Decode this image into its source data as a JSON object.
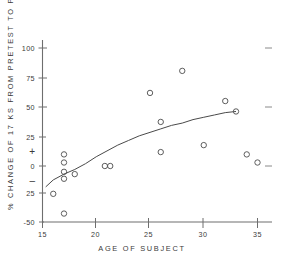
{
  "chart_data": {
    "type": "scatter",
    "title": "",
    "xlabel": "AGE OF SUBJECT",
    "ylabel": "% CHANGE OF 17 KS FROM PRETEST TO POST TEST",
    "xlim": [
      15,
      36
    ],
    "ylim": [
      -50,
      110
    ],
    "xticks": [
      15,
      20,
      25,
      30,
      35
    ],
    "xtick_labels": [
      "15",
      "20",
      "25",
      "30",
      "35"
    ],
    "yticks": [
      -50,
      -25,
      0,
      25,
      50,
      75,
      100
    ],
    "ytick_labels": [
      "-50",
      "25",
      "0",
      "25",
      "50",
      "75",
      "100"
    ],
    "y_sign_markers": [
      {
        "label": "+",
        "value": 12
      },
      {
        "label": "–",
        "value": -12
      }
    ],
    "grid": false,
    "legend": null,
    "marker": "open-circle",
    "points": [
      {
        "x": 16,
        "y": -24
      },
      {
        "x": 17,
        "y": -41
      },
      {
        "x": 17,
        "y": 10
      },
      {
        "x": 17,
        "y": -5
      },
      {
        "x": 17,
        "y": 3
      },
      {
        "x": 17,
        "y": -11
      },
      {
        "x": 18,
        "y": -7
      },
      {
        "x": 20.8,
        "y": 0
      },
      {
        "x": 21.3,
        "y": 0
      },
      {
        "x": 25,
        "y": 63
      },
      {
        "x": 26,
        "y": 38
      },
      {
        "x": 26,
        "y": 12
      },
      {
        "x": 28,
        "y": 82
      },
      {
        "x": 30,
        "y": 18
      },
      {
        "x": 32,
        "y": 56
      },
      {
        "x": 33,
        "y": 47
      },
      {
        "x": 34,
        "y": 10
      },
      {
        "x": 35,
        "y": 3
      }
    ],
    "fit_curve": {
      "description": "smooth increasing logarithmic trend line",
      "points": [
        {
          "x": 15.3,
          "y": -18
        },
        {
          "x": 16,
          "y": -12
        },
        {
          "x": 17,
          "y": -7
        },
        {
          "x": 18,
          "y": -3
        },
        {
          "x": 19,
          "y": 2
        },
        {
          "x": 20,
          "y": 8
        },
        {
          "x": 21,
          "y": 13
        },
        {
          "x": 22,
          "y": 18
        },
        {
          "x": 23,
          "y": 22
        },
        {
          "x": 24,
          "y": 26
        },
        {
          "x": 25,
          "y": 29
        },
        {
          "x": 26,
          "y": 32
        },
        {
          "x": 27,
          "y": 35
        },
        {
          "x": 28,
          "y": 37
        },
        {
          "x": 29,
          "y": 40
        },
        {
          "x": 30,
          "y": 42
        },
        {
          "x": 31,
          "y": 44
        },
        {
          "x": 32,
          "y": 46
        },
        {
          "x": 33,
          "y": 47
        }
      ]
    },
    "right_edge_marks": [
      100,
      50,
      0
    ]
  }
}
